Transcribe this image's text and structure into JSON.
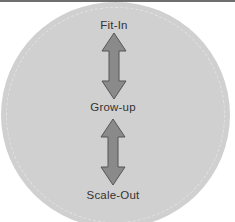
{
  "diagram": {
    "title": "",
    "nodes": [
      {
        "id": "fit-in",
        "label": "Fit-In"
      },
      {
        "id": "grow-up",
        "label": "Grow-up"
      },
      {
        "id": "scale-out",
        "label": "Scale-Out"
      }
    ],
    "edges": [
      {
        "from": "fit-in",
        "to": "grow-up",
        "type": "bidirectional-arrow"
      },
      {
        "from": "grow-up",
        "to": "scale-out",
        "type": "bidirectional-arrow"
      }
    ],
    "colors": {
      "circle_fill": "#d0d0d0",
      "arrow_fill": "#8a8a8a",
      "arrow_stroke": "#555555",
      "text": "#333333"
    }
  }
}
